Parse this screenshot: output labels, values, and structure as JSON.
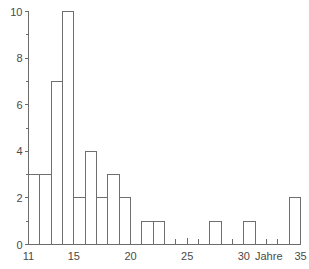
{
  "chart_data": {
    "type": "bar",
    "title": "",
    "subtitle": "",
    "xlabel": "Jahre",
    "ylabel": "",
    "xlim": [
      11,
      35
    ],
    "ylim": [
      0,
      10
    ],
    "grid": false,
    "legend": null,
    "bin_width": 1,
    "x_tick_labels": [
      "11",
      "15",
      "20",
      "25",
      "30",
      "35"
    ],
    "x_tick_values": [
      11,
      15,
      20,
      25,
      30,
      35
    ],
    "x_minor_ticks": [
      11,
      12,
      13,
      14,
      15,
      16,
      17,
      18,
      19,
      20,
      21,
      22,
      23,
      24,
      25,
      26,
      27,
      28,
      29,
      30,
      31,
      32,
      33,
      34,
      35
    ],
    "y_tick_labels": [
      "0",
      "2",
      "4",
      "6",
      "8",
      "10"
    ],
    "y_tick_values": [
      0,
      2,
      4,
      6,
      8,
      10
    ],
    "y_minor_ticks": [
      1,
      3,
      5,
      7,
      9
    ],
    "categories": [
      "11-12",
      "12-13",
      "13-14",
      "14-15",
      "15-16",
      "16-17",
      "17-18",
      "18-19",
      "19-20",
      "20-21",
      "21-22",
      "22-23",
      "23-24",
      "24-25",
      "25-26",
      "26-27",
      "27-28",
      "28-29",
      "29-30",
      "30-31",
      "31-32",
      "32-33",
      "33-34",
      "34-35"
    ],
    "bin_starts": [
      11,
      12,
      13,
      14,
      15,
      16,
      17,
      18,
      19,
      20,
      21,
      22,
      23,
      24,
      25,
      26,
      27,
      28,
      29,
      30,
      31,
      32,
      33,
      34
    ],
    "values": [
      3,
      3,
      7,
      10,
      2,
      4,
      2,
      3,
      2,
      0,
      1,
      1,
      0,
      0,
      0,
      0,
      1,
      0,
      0,
      1,
      0,
      0,
      0,
      2
    ],
    "colors": {
      "bar_stroke": "#6f6f6f",
      "bar_fill": "none",
      "axis": "#6b6b6b",
      "text": "#4a4a4a",
      "background": "#ffffff"
    }
  }
}
